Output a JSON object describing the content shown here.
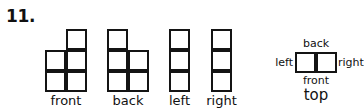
{
  "problem": {
    "number": "11."
  },
  "views": [
    {
      "name": "front",
      "label": "front",
      "shape": "2x2-plus-top-right",
      "cells": [
        {
          "col": 1,
          "row": 0
        },
        {
          "col": 0,
          "row": 1
        },
        {
          "col": 1,
          "row": 1
        },
        {
          "col": 0,
          "row": 2
        },
        {
          "col": 1,
          "row": 2
        }
      ]
    },
    {
      "name": "back",
      "label": "back",
      "shape": "2x2-plus-top-left",
      "cells": [
        {
          "col": 0,
          "row": 0
        },
        {
          "col": 0,
          "row": 1
        },
        {
          "col": 1,
          "row": 1
        },
        {
          "col": 0,
          "row": 2
        },
        {
          "col": 1,
          "row": 2
        }
      ]
    },
    {
      "name": "left",
      "label": "left",
      "shape": "1x3-column",
      "cells": [
        {
          "col": 0,
          "row": 0
        },
        {
          "col": 0,
          "row": 1
        },
        {
          "col": 0,
          "row": 2
        }
      ]
    },
    {
      "name": "right",
      "label": "right",
      "shape": "1x3-column",
      "cells": [
        {
          "col": 0,
          "row": 0
        },
        {
          "col": 0,
          "row": 1
        },
        {
          "col": 0,
          "row": 2
        }
      ]
    }
  ],
  "top_view": {
    "box_cells": 2,
    "labels": {
      "back": "back",
      "left": "left",
      "right": "right",
      "front": "front",
      "top": "top"
    }
  },
  "colors": {
    "background": "#ffffff",
    "stroke": "#141414",
    "text": "#111111"
  }
}
